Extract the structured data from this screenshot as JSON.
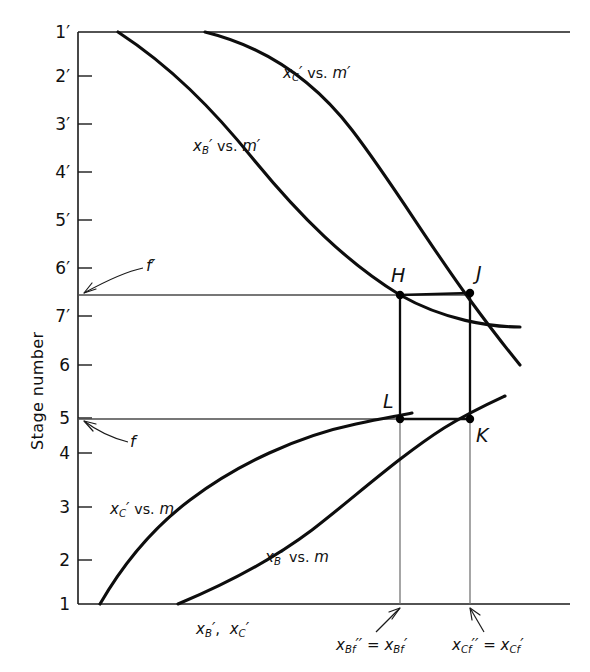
{
  "figure": {
    "type": "engineering-diagram",
    "background_color": "#ffffff",
    "ink_color": "#111111"
  },
  "axes": {
    "y_axis_title": "Stage number",
    "x_axis_label_parts": {
      "x": "x",
      "subB": "B",
      "prime": "′",
      "comma": ", ",
      "subC": "C"
    },
    "x_axis_label_text": "x′B , x′C",
    "y_tick_labels": [
      "1′",
      "2′",
      "3′",
      "4′",
      "5′",
      "6′",
      "7′",
      "6",
      "5",
      "4",
      "3",
      "2",
      "1"
    ],
    "y_tick_positions": [
      32,
      76,
      124,
      172,
      220,
      268,
      316,
      365,
      418,
      453,
      507,
      560,
      604
    ],
    "plot_left": 78,
    "plot_right": 570,
    "plot_top": 32,
    "plot_bottom": 604
  },
  "curves": [
    {
      "id": "xc-vs-mprime",
      "label_text": "x′C vs. m′",
      "label_x": 283,
      "label_y": 64,
      "section": "rectifying",
      "path": "M 205,32 C 262,46 312,78 352,130 C 392,182 430,246 470,300 C 492,330 506,348 520,365"
    },
    {
      "id": "xb-vs-mprime",
      "label_text": "x′B vs. m′",
      "label_x": 193,
      "label_y": 137,
      "section": "rectifying",
      "path": "M 118,32 C 170,66 212,108 254,160 C 300,216 346,262 400,295 C 444,320 490,327 520,327"
    },
    {
      "id": "xc-vs-m",
      "label_text": "x′C vs. m",
      "label_x": 110,
      "label_y": 500,
      "section": "stripping",
      "path": "M 100,604 C 122,566 150,530 190,500 C 238,464 298,436 356,424 C 384,418 398,416 412,413"
    },
    {
      "id": "xb-vs-m",
      "label_text": "x′B vs. m",
      "label_x": 265,
      "label_y": 548,
      "section": "stripping",
      "path": "M 178,604 C 226,584 272,560 312,530 C 356,496 400,456 444,428 C 470,412 492,402 505,396"
    }
  ],
  "feed_lines": [
    {
      "id": "f-prime-line",
      "label": "f′",
      "y": 295,
      "x_start": 78,
      "x_end": 470,
      "annot_x": 118,
      "annot_y": 262
    },
    {
      "id": "f-line",
      "label": "f",
      "y": 419,
      "x_start": 78,
      "x_end": 470,
      "annot_x": 108,
      "annot_y": 435
    }
  ],
  "points": [
    {
      "id": "H",
      "label": "H",
      "x": 400,
      "y": 295,
      "label_x": 391,
      "label_y": 264
    },
    {
      "id": "J",
      "label": "J",
      "x": 470,
      "y": 293,
      "label_x": 476,
      "label_y": 262
    },
    {
      "id": "L",
      "label": "L",
      "x": 400,
      "y": 419,
      "label_x": 383,
      "label_y": 390
    },
    {
      "id": "K",
      "label": "K",
      "x": 470,
      "y": 419,
      "label_x": 476,
      "label_y": 424
    }
  ],
  "tie_lines": [
    {
      "id": "HL-vertical",
      "from": "H",
      "to": "L"
    },
    {
      "id": "JK-vertical",
      "from": "J",
      "to": "K"
    },
    {
      "id": "HJ-horizontal",
      "from": "H",
      "to": "J"
    },
    {
      "id": "LK-horizontal",
      "from": "L",
      "to": "K"
    }
  ],
  "drop_lines": [
    {
      "id": "drop-Bf",
      "x": 400,
      "y_start": 419,
      "y_end": 604
    },
    {
      "id": "drop-Cf",
      "x": 470,
      "y_start": 419,
      "y_end": 604
    }
  ],
  "bottom_annotations": [
    {
      "id": "xbf-equality",
      "text": "x′Bf′ = x′Bf",
      "label_x": 336,
      "label_y": 636,
      "arrow_from_x": 376,
      "arrow_from_y": 632,
      "arrow_to_x": 400,
      "arrow_to_y": 608
    },
    {
      "id": "xcf-equality",
      "text": "x′Cf′ = x′Cf",
      "label_x": 446,
      "label_y": 636,
      "arrow_from_x": 478,
      "arrow_from_y": 632,
      "arrow_to_x": 470,
      "arrow_to_y": 608
    }
  ]
}
